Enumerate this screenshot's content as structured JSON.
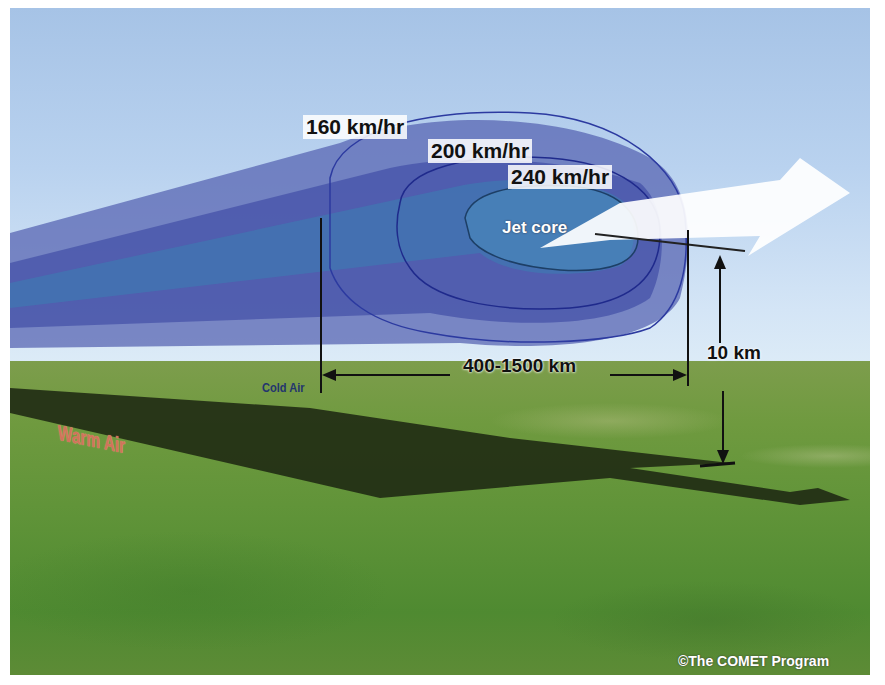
{
  "diagram": {
    "speed_contours": [
      {
        "label": "160 km/hr",
        "color": "#5a68b8"
      },
      {
        "label": "200 km/hr",
        "color": "#3b4ba6"
      },
      {
        "label": "240 km/hr",
        "color": "#3d7fb4"
      }
    ],
    "jet_core_label": "Jet core",
    "width_label": "400-1500 km",
    "height_label": "10 km",
    "cold_air_label": "Cold Air",
    "warm_air_label": "Warm Air",
    "credit": "©The COMET Program",
    "colors": {
      "sky": "#b9d2ef",
      "ground": "#6f9a3f",
      "shadow": "#1f2a14",
      "flow_arrow": "#ffffff",
      "warm_air": "#d0745a",
      "cold_air": "#23356e"
    }
  }
}
